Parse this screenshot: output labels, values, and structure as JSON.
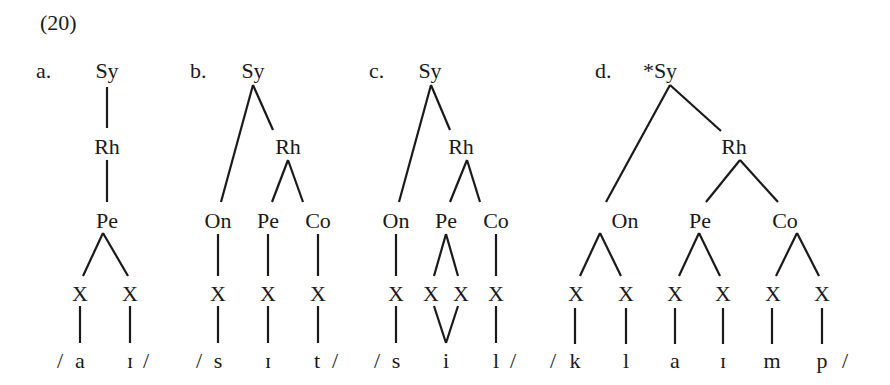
{
  "example_number": "(20)",
  "panels": [
    {
      "label": "a.",
      "root": "Sy",
      "nodes": {
        "rhyme": "Rh",
        "peak": "Pe"
      },
      "skeleton": [
        "X",
        "X"
      ],
      "segments": {
        "open": "/",
        "items": [
          "a",
          "ɪ"
        ],
        "close": "/"
      }
    },
    {
      "label": "b.",
      "root": "Sy",
      "nodes": {
        "rhyme": "Rh",
        "onset": "On",
        "peak": "Pe",
        "coda": "Co"
      },
      "skeleton": [
        "X",
        "X",
        "X"
      ],
      "segments": {
        "open": "/",
        "items": [
          "s",
          "ɪ",
          "t"
        ],
        "close": "/"
      }
    },
    {
      "label": "c.",
      "root": "Sy",
      "nodes": {
        "rhyme": "Rh",
        "onset": "On",
        "peak": "Pe",
        "coda": "Co"
      },
      "skeleton": [
        "X",
        "X",
        "X",
        "X"
      ],
      "segments": {
        "open": "/",
        "items": [
          "s",
          "i",
          "l"
        ],
        "close": "/"
      }
    },
    {
      "label": "d.",
      "root": "*Sy",
      "nodes": {
        "rhyme": "Rh",
        "onset": "On",
        "peak": "Pe",
        "coda": "Co"
      },
      "skeleton": [
        "X",
        "X",
        "X",
        "X",
        "X",
        "X"
      ],
      "segments": {
        "open": "/",
        "items": [
          "k",
          "l",
          "a",
          "ɪ",
          "m",
          "p"
        ],
        "close": "/"
      }
    }
  ]
}
